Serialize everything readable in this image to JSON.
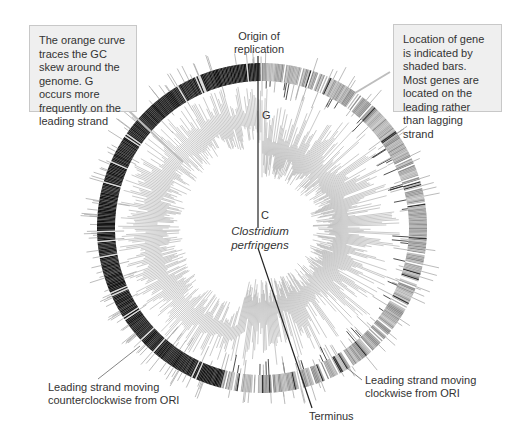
{
  "diagram": {
    "organism": {
      "line1": "Clostridium",
      "line2": "perfringens"
    },
    "origin_label": {
      "line1": "Origin of",
      "line2": "replication"
    },
    "terminus_label": "Terminus",
    "skew_labels": {
      "g": "G",
      "c": "C"
    },
    "callouts": {
      "gc_skew": "The orange curve traces the GC skew around the genome. G occurs more frequently on the leading strand",
      "gene_location": "Location of gene is indicated by shaded bars. Most genes are located on the leading rather than lagging strand"
    },
    "strand_labels": {
      "counterclockwise": {
        "line1": "Leading strand moving",
        "line2": "counterclockwise from ORI"
      },
      "clockwise": {
        "line1": "Leading strand moving",
        "line2": "clockwise from ORI"
      }
    },
    "colors": {
      "left_band": "#1a1a1a",
      "right_band": "#9a9a9a",
      "skew": "#8a8a8a",
      "leader": "#b0b0b0",
      "axis_line": "#222222"
    }
  }
}
